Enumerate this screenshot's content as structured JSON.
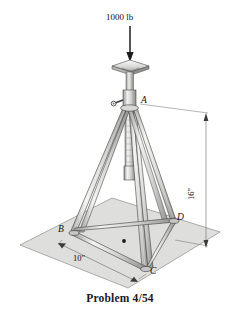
{
  "figure": {
    "caption": "Problem 4/54",
    "load": {
      "label": "1000 lb",
      "direction": "down",
      "arrow_name": "load-arrow"
    },
    "dimensions": [
      {
        "id": "height",
        "label": "16\"",
        "orientation": "vertical"
      },
      {
        "id": "base-span",
        "label": "10\"",
        "orientation": "oblique"
      }
    ],
    "points": [
      {
        "id": "A",
        "label": "A",
        "role": "apex"
      },
      {
        "id": "B",
        "label": "B",
        "role": "foot-left"
      },
      {
        "id": "C",
        "label": "C",
        "role": "foot-front"
      },
      {
        "id": "D",
        "label": "D",
        "role": "foot-right"
      }
    ],
    "parts": [
      {
        "id": "top-plate",
        "name": "load-bearing-plate"
      },
      {
        "id": "screw-column",
        "name": "telescoping-screw-column"
      },
      {
        "id": "crank-handle",
        "name": "crank-handle"
      },
      {
        "id": "leg-ab",
        "name": "leg-a-to-b"
      },
      {
        "id": "leg-ac",
        "name": "leg-a-to-c"
      },
      {
        "id": "leg-ad",
        "name": "leg-a-to-d"
      },
      {
        "id": "base-bc",
        "name": "base-rail-b-c"
      },
      {
        "id": "base-cd",
        "name": "base-rail-c-d"
      },
      {
        "id": "base-bd",
        "name": "base-rail-b-d"
      },
      {
        "id": "ground-plane",
        "name": "ground-plane"
      },
      {
        "id": "center-dot",
        "name": "base-center-point"
      }
    ],
    "colors": {
      "ground_fill": "#dededd",
      "ground_stroke": "#8d8d8d",
      "metal_light": "#f2f2f1",
      "metal_mid": "#c9c9c7",
      "metal_dark": "#9a9a98",
      "line": "#3a3a3a",
      "text": "#111111"
    }
  }
}
